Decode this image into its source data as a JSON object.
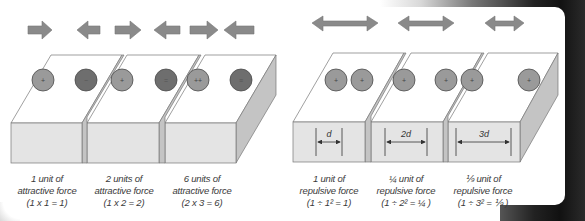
{
  "colors": {
    "arrow_fill": "#8a8a8a",
    "arrow_stroke": "#6f6f6f",
    "positive_circle": "#9a9a9a",
    "negative_circle": "#6e6e6e",
    "circle_stroke": "#4a4a4a",
    "box_front": "#e4e4e4",
    "box_top": "#ffffff",
    "box_side": "#c4c4c4",
    "edge": "#777777"
  },
  "attractive": {
    "arrows": [
      "right-arrow",
      "left-arrow",
      "right-arrow",
      "left-arrow",
      "right-arrow",
      "left-arrow"
    ],
    "boxes": [
      {
        "charges": [
          {
            "sign": "+",
            "type": "positive"
          },
          {
            "sign": "−",
            "type": "negative"
          }
        ],
        "label": {
          "line1": "1 unit of",
          "line2": "attractive force",
          "line3": "(1 x 1 = 1)"
        }
      },
      {
        "charges": [
          {
            "sign": "+",
            "type": "positive"
          },
          {
            "sign": "=",
            "type": "negative"
          }
        ],
        "label": {
          "line1": "2 units of",
          "line2": "attractive force",
          "line3": "(1 x 2 = 2)"
        }
      },
      {
        "charges": [
          {
            "sign": "++",
            "type": "positive"
          },
          {
            "sign": "≡",
            "type": "negative"
          }
        ],
        "label": {
          "line1": "6 units of",
          "line2": "attractive force",
          "line3": "(2 x 3 = 6)"
        }
      }
    ]
  },
  "repulsive": {
    "arrows": [
      "double-arrow-long",
      "double-arrow-medium",
      "double-arrow-short"
    ],
    "boxes": [
      {
        "charges": [
          {
            "sign": "+",
            "type": "positive"
          },
          {
            "sign": "+",
            "type": "positive"
          }
        ],
        "distance": "d",
        "label": {
          "line1": "1 unit of",
          "line2": "repulsive force",
          "line3": "(1 ÷ 1² = 1)"
        }
      },
      {
        "charges": [
          {
            "sign": "+",
            "type": "positive"
          },
          {
            "sign": "+",
            "type": "positive"
          }
        ],
        "distance": "2d",
        "label": {
          "line1": "¼ unit of",
          "line2": "repulsive force",
          "line3": "(1 ÷ 2² = ¼ )"
        }
      },
      {
        "charges": [
          {
            "sign": "+",
            "type": "positive"
          },
          {
            "sign": "+",
            "type": "positive"
          }
        ],
        "distance": "3d",
        "label": {
          "line1": "⅑  unit of",
          "line2": "repulsive force",
          "line3": "(1 ÷ 3² = ⅑ )"
        }
      }
    ]
  }
}
